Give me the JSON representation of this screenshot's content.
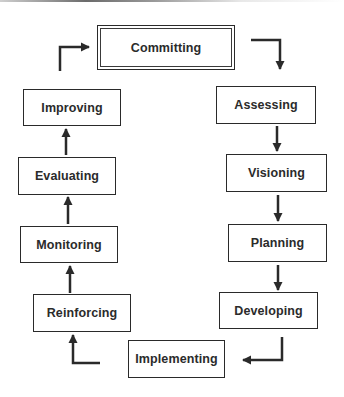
{
  "diagram": {
    "type": "cycle-flow",
    "stages": [
      {
        "id": "committing",
        "label": "Committing",
        "emphasized": true
      },
      {
        "id": "assessing",
        "label": "Assessing"
      },
      {
        "id": "visioning",
        "label": "Visioning"
      },
      {
        "id": "planning",
        "label": "Planning"
      },
      {
        "id": "developing",
        "label": "Developing"
      },
      {
        "id": "implementing",
        "label": "Implementing"
      },
      {
        "id": "reinforcing",
        "label": "Reinforcing"
      },
      {
        "id": "monitoring",
        "label": "Monitoring"
      },
      {
        "id": "evaluating",
        "label": "Evaluating"
      },
      {
        "id": "improving",
        "label": "Improving"
      }
    ],
    "edges": [
      {
        "from": "committing",
        "to": "assessing"
      },
      {
        "from": "assessing",
        "to": "visioning"
      },
      {
        "from": "visioning",
        "to": "planning"
      },
      {
        "from": "planning",
        "to": "developing"
      },
      {
        "from": "developing",
        "to": "implementing"
      },
      {
        "from": "implementing",
        "to": "reinforcing"
      },
      {
        "from": "reinforcing",
        "to": "monitoring"
      },
      {
        "from": "monitoring",
        "to": "evaluating"
      },
      {
        "from": "evaluating",
        "to": "improving"
      },
      {
        "from": "improving",
        "to": "committing"
      }
    ],
    "colors": {
      "stroke": "#2a2a2a",
      "text": "#2b2b2b",
      "background": "#ffffff"
    }
  }
}
